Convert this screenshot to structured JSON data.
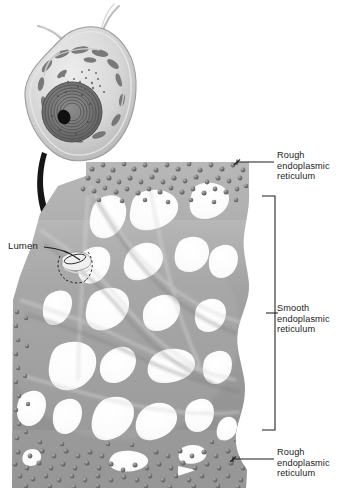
{
  "figure": {
    "background_color": "#ffffff",
    "ink_color": "#1d1d1d",
    "membrane_color": "#9a9a9a",
    "membrane_highlight": "#cfcfcf",
    "membrane_shadow": "#6f6f6f",
    "ribosome_color": "#6b6b6b",
    "lumen_color": "#f4f4f4",
    "arrow_color": "#161616"
  },
  "labels": {
    "rough_er_top": "Rough\nendoplasmic\nreticulum",
    "smooth_er": "Smooth\nendoplasmic\nreticulum",
    "rough_er_bottom": "Rough\nendoplasmic\nreticulum",
    "lumen": "Lumen"
  },
  "cell_inset": {
    "name": "eukaryotic-cell-overview",
    "organelles": [
      "flagella",
      "plasma-membrane",
      "cytoplasm",
      "mitochondria",
      "nucleus",
      "nucleolus",
      "endoplasmic-reticulum"
    ]
  },
  "regions": [
    {
      "id": "rough-er-top",
      "kind": "rough",
      "label": "Rough endoplasmic reticulum",
      "ribosomes": true
    },
    {
      "id": "smooth-er",
      "kind": "smooth",
      "label": "Smooth endoplasmic reticulum",
      "ribosomes": false
    },
    {
      "id": "rough-er-bottom",
      "kind": "rough",
      "label": "Rough endoplasmic reticulum",
      "ribosomes": true
    }
  ],
  "connectors": {
    "rough_top_leader": "line-with-tick",
    "smooth_bracket": "square-bracket",
    "rough_bottom_leader": "line-with-tick",
    "lumen_leader": "curved-line",
    "magnify_arrow": "curved-black-arrow"
  }
}
